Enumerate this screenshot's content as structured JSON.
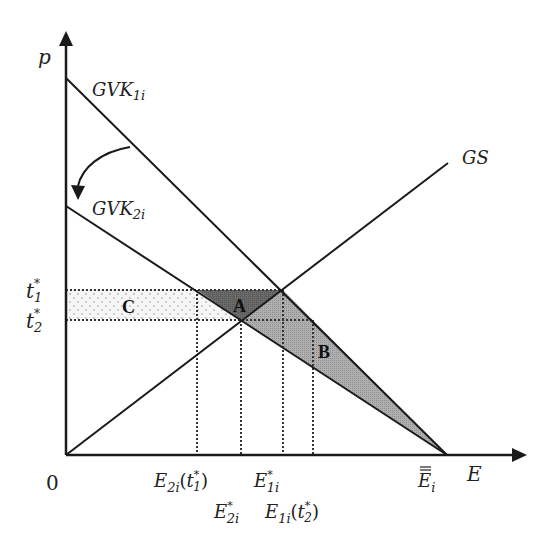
{
  "diagram": {
    "axes": {
      "y_label": "p",
      "x_label": "E",
      "origin_label": "0"
    },
    "curves": {
      "gvk1": {
        "label_main": "GVK",
        "label_sub": "1i"
      },
      "gvk2": {
        "label_main": "GVK",
        "label_sub": "2i"
      },
      "gs": {
        "label": "GS"
      }
    },
    "price_levels": {
      "t1": {
        "main": "t",
        "sub": "1",
        "sup": "*"
      },
      "t2": {
        "main": "t",
        "sub": "2",
        "sup": "*"
      }
    },
    "areas": {
      "A": "A",
      "B": "B",
      "C": "C"
    },
    "x_ticks": {
      "e2i_t1": {
        "main": "E",
        "sub": "2i",
        "arg_main": "t",
        "arg_sub": "1",
        "arg_sup": "*"
      },
      "e2i_star": {
        "main": "E",
        "sub": "2i",
        "sup": "*"
      },
      "e1i_star": {
        "main": "E",
        "sub": "1i",
        "sup": "*"
      },
      "e1i_t2": {
        "main": "E",
        "sub": "1i",
        "arg_main": "t",
        "arg_sub": "2",
        "arg_sup": "*"
      },
      "ebar": {
        "main": "E",
        "sub": "i",
        "overline": "="
      }
    },
    "colors": {
      "line": "#1a1a1a",
      "area_A": "#6e6e6e",
      "area_B": "#a9a9a9",
      "area_C": "#f0f0f0",
      "dots": "#333333"
    }
  }
}
